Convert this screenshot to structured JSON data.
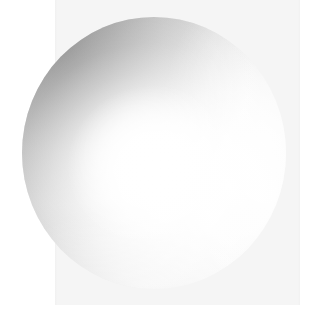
{
  "canvas": {
    "width": 314,
    "height": 319,
    "outer_background_color": "#ffffff"
  },
  "backdrop_panel": {
    "fill_color": "#f5f5f5",
    "left": 55,
    "top": 0,
    "width": 245,
    "height": 305
  },
  "sphere": {
    "center_x": 154,
    "center_y": 153,
    "radius": 132,
    "bounding_left": 22,
    "bounding_top": 17,
    "bounding_width": 264,
    "bounding_height": 272,
    "highlight_color": "#ffffff",
    "midtone_color": "#d9d9d9",
    "shadow_color": "#8d8d8d",
    "darkest_color": "#888888",
    "highlight_center_x": 152,
    "highlight_center_y": 168,
    "light_direction": "upper-right",
    "shadow_quadrant": "upper-left",
    "material": "matte-gradient"
  }
}
